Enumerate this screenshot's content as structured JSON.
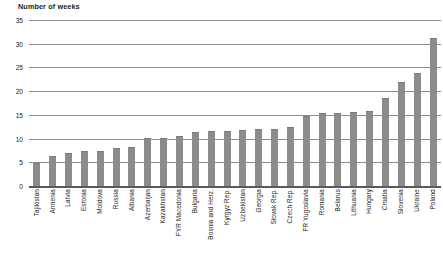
{
  "chart_data": {
    "type": "bar",
    "title": "Number of weeks",
    "xlabel": "",
    "ylabel": "Number of weeks",
    "ylim": [
      0,
      35
    ],
    "yticks": [
      0,
      5,
      10,
      15,
      20,
      25,
      30,
      35
    ],
    "grid": true,
    "legend": "none",
    "bar_color": "#8c8c8c",
    "orientation": "vertical",
    "categories": [
      "Tajikistan",
      "Armenia",
      "Latvia",
      "Estonia",
      "Moldova",
      "Russia",
      "Albania",
      "Azerbaijan",
      "Kazakhstan",
      "FYR Macedonia",
      "Bulgaria",
      "Bosnia and Herz.",
      "Kyrgyz Rep.",
      "Uzbekistan",
      "Georgia",
      "Slovak Rep.",
      "Czech Rep.",
      "FR Yugoslavia",
      "Romania",
      "Belarus",
      "Lithuania",
      "Hungary",
      "Croatia",
      "Slovenia",
      "Ukraine",
      "Poland"
    ],
    "values": [
      4.6,
      6.2,
      6.7,
      7.2,
      7.2,
      7.8,
      8.0,
      9.9,
      10.0,
      10.4,
      11.1,
      11.3,
      11.4,
      11.5,
      11.8,
      11.9,
      12.2,
      14.6,
      15.1,
      15.2,
      15.5,
      15.7,
      18.3,
      21.7,
      23.7,
      31.0
    ]
  }
}
